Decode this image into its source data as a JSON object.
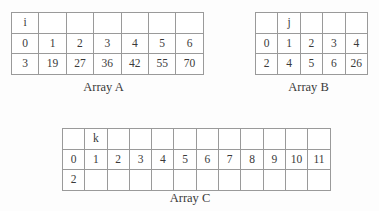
{
  "figure": {
    "background_color": "#fdfdfd",
    "line_color": "#9a9a9a",
    "text_color": "#3a3a3a"
  },
  "arrays": [
    {
      "id": "array-a",
      "caption": "Array A",
      "columns": 7,
      "index_variable": "i",
      "index_variable_column": 0,
      "rows": [
        {
          "name": "variable-row",
          "cells": [
            "i",
            "",
            "",
            "",
            "",
            "",
            ""
          ]
        },
        {
          "name": "index-row",
          "cells": [
            "0",
            "1",
            "2",
            "3",
            "4",
            "5",
            "6"
          ]
        },
        {
          "name": "value-row",
          "cells": [
            "3",
            "19",
            "27",
            "36",
            "42",
            "55",
            "70"
          ]
        }
      ]
    },
    {
      "id": "array-b",
      "caption": "Array B",
      "columns": 5,
      "index_variable": "j",
      "index_variable_column": 1,
      "rows": [
        {
          "name": "variable-row",
          "cells": [
            "",
            "j",
            "",
            "",
            ""
          ]
        },
        {
          "name": "index-row",
          "cells": [
            "0",
            "1",
            "2",
            "3",
            "4"
          ]
        },
        {
          "name": "value-row",
          "cells": [
            "2",
            "4",
            "5",
            "6",
            "26"
          ]
        }
      ]
    },
    {
      "id": "array-c",
      "caption": "Array C",
      "columns": 12,
      "index_variable": "k",
      "index_variable_column": 1,
      "rows": [
        {
          "name": "variable-row",
          "cells": [
            "",
            "k",
            "",
            "",
            "",
            "",
            "",
            "",
            "",
            "",
            "",
            ""
          ]
        },
        {
          "name": "index-row",
          "cells": [
            "0",
            "1",
            "2",
            "3",
            "4",
            "5",
            "6",
            "7",
            "8",
            "9",
            "10",
            "11"
          ]
        },
        {
          "name": "value-row",
          "cells": [
            "2",
            "",
            "",
            "",
            "",
            "",
            "",
            "",
            "",
            "",
            "",
            ""
          ]
        }
      ]
    }
  ]
}
